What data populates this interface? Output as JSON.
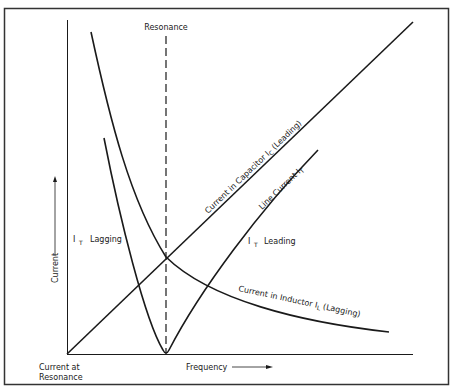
{
  "diagram": {
    "colors": {
      "stroke": "#1a1a1a",
      "border": "#333333",
      "background": "#ffffff"
    },
    "labels": {
      "resonance": "Resonance",
      "y_axis": "Current",
      "x_axis": "Frequency",
      "origin_line1": "Current at",
      "origin_line2": "Resonance",
      "it_lagging_main": "I",
      "it_lagging_sub": "T",
      "it_lagging_text": "Lagging",
      "it_leading_main": "I",
      "it_leading_sub": "T",
      "it_leading_text": "Leading",
      "capacitor_curve_pre": "Current in Capacitor I",
      "capacitor_curve_sub": "C",
      "capacitor_curve_post": " (Leading)",
      "line_current_pre": "Line Current I",
      "line_current_sub": "T",
      "inductor_curve_pre": "Current in Inductor I",
      "inductor_curve_sub": "L",
      "inductor_curve_post": " (Lagging)"
    },
    "curves": [
      {
        "name": "Current in Capacitor I_C (Leading)",
        "shape": "straight line from origin, increasing with frequency"
      },
      {
        "name": "Current in Inductor I_L (Lagging)",
        "shape": "hyperbolic decay with frequency"
      },
      {
        "name": "Line Current I_T",
        "shape": "V-shaped minimum at resonance; lagging below, leading above"
      }
    ],
    "annotations": [
      {
        "text": "Resonance",
        "type": "dashed vertical line at resonant frequency"
      }
    ]
  }
}
